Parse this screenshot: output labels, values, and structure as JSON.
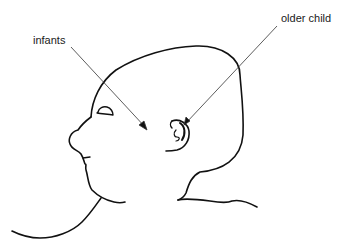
{
  "diagram": {
    "type": "anatomical-sketch",
    "labels": [
      {
        "id": "infants",
        "text": "infants"
      },
      {
        "id": "older",
        "text": "older child"
      }
    ],
    "colors": {
      "line": "#111111",
      "background": "#ffffff",
      "text": "#1a1a1a"
    }
  }
}
